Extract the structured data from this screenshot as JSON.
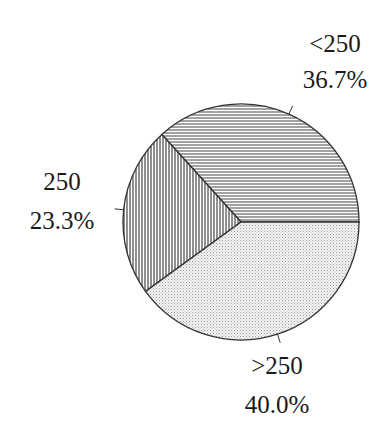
{
  "chart_data": {
    "type": "pie",
    "title": "",
    "start_angle_deg": 0,
    "direction": "counterclockwise",
    "slices": [
      {
        "label": "<250",
        "percent_label": "36.7%",
        "value": 36.7,
        "pattern": "horizontal-lines"
      },
      {
        "label": "250",
        "percent_label": "23.3%",
        "value": 23.3,
        "pattern": "vertical-lines"
      },
      {
        "label": ">250",
        "percent_label": "40.0%",
        "value": 40.0,
        "pattern": "dots"
      }
    ],
    "legend": "none",
    "colors": {
      "outline": "#333333",
      "hatch": "#555555",
      "dots": "#9a9a9a",
      "background": "#ffffff"
    }
  }
}
